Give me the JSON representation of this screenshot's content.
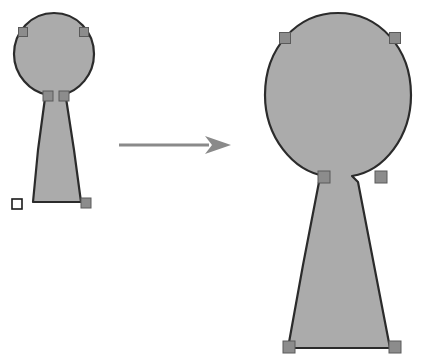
{
  "canvas": {
    "width": 428,
    "height": 362,
    "background": "#ffffff",
    "title": "Keyhole shape scaling illustration"
  },
  "style": {
    "shape_fill": "#ababab",
    "shape_stroke": "#2b2b2b",
    "shape_stroke_width": 2.2,
    "handle_solid_fill": "#8c8c8c",
    "handle_solid_stroke": "#5a5a5a",
    "handle_open_fill": "#ffffff",
    "handle_open_stroke": "#1a1a1a",
    "arrow_color": "#8a8a8a",
    "handle_size_small": 9,
    "handle_size_large": 11
  },
  "objects": {
    "source_shape": {
      "label": "small keyhole shape",
      "state": "selected",
      "bbox": {
        "x": 12,
        "y": 12,
        "width": 84,
        "height": 196
      },
      "path": "M 54 13 C 31 13 14 32 14 54 C 14 75 30 92 48 95 L 45 98 L 38 150 L 33 202 L 81 202 L 74 150 L 66 98 L 62 95 C 79 91 94 75 94 54 C 94 32 77 13 54 13 Z",
      "handles": [
        {
          "name": "anchor-bottom-left",
          "type": "open",
          "x": 17,
          "y": 204,
          "size": 10
        },
        {
          "name": "anchor-bottom-right",
          "type": "solid",
          "x": 86,
          "y": 203,
          "size": 10
        },
        {
          "name": "anchor-neck-left",
          "type": "solid",
          "x": 48,
          "y": 96,
          "size": 10
        },
        {
          "name": "anchor-neck-right",
          "type": "solid",
          "x": 64,
          "y": 96,
          "size": 10
        },
        {
          "name": "anchor-circle-upper-left",
          "type": "solid",
          "x": 23,
          "y": 32,
          "size": 9
        },
        {
          "name": "anchor-circle-upper-right",
          "type": "solid",
          "x": 84,
          "y": 32,
          "size": 9
        }
      ]
    },
    "result_shape": {
      "label": "large keyhole shape",
      "state": "selected",
      "bbox": {
        "x": 262,
        "y": 12,
        "width": 152,
        "height": 340
      },
      "path": "M 338 13 C 297 13 265 48 265 95 C 265 137 293 171 325 176 L 319 182 L 303 265 L 288 348 L 390 348 L 374 265 L 358 182 L 352 176 C 384 171 411 137 411 95 C 411 48 379 13 338 13 Z",
      "handles": [
        {
          "name": "anchor-bottom-left",
          "type": "solid",
          "x": 289,
          "y": 347,
          "size": 12
        },
        {
          "name": "anchor-bottom-right",
          "type": "solid",
          "x": 395,
          "y": 347,
          "size": 12
        },
        {
          "name": "anchor-neck-left",
          "type": "solid",
          "x": 324,
          "y": 177,
          "size": 12
        },
        {
          "name": "anchor-neck-right",
          "type": "solid",
          "x": 381,
          "y": 177,
          "size": 12
        },
        {
          "name": "anchor-circle-upper-left",
          "type": "solid",
          "x": 285,
          "y": 38,
          "size": 11
        },
        {
          "name": "anchor-circle-upper-right",
          "type": "solid",
          "x": 395,
          "y": 38,
          "size": 11
        }
      ]
    },
    "transform_arrow": {
      "label": "transform arrow",
      "direction": "right",
      "start": {
        "x": 119,
        "y": 145
      },
      "end": {
        "x": 231,
        "y": 145
      },
      "shaft_thickness": 3,
      "head_length": 26,
      "head_half_width": 9
    }
  }
}
